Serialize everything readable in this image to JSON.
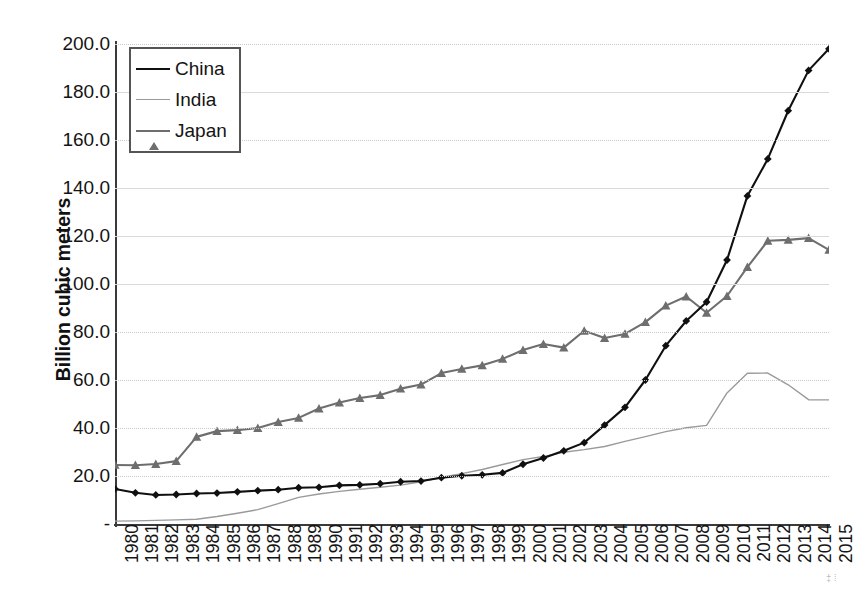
{
  "chart_data": {
    "type": "line",
    "title": "",
    "subtitle": "",
    "xlabel": "",
    "ylabel": "Billion cubic meters",
    "grid": true,
    "legend_position": "top-left",
    "xlim": [
      1980,
      2015
    ],
    "ylim": [
      0,
      200
    ],
    "ytick_labels": [
      "-",
      "20.0",
      "40.0",
      "60.0",
      "80.0",
      "100.0",
      "120.0",
      "140.0",
      "160.0",
      "180.0",
      "200.0"
    ],
    "ytick_values": [
      0,
      20,
      40,
      60,
      80,
      100,
      120,
      140,
      160,
      180,
      200
    ],
    "categories": [
      "1980",
      "1981",
      "1982",
      "1983",
      "1984",
      "1985",
      "1986",
      "1987",
      "1988",
      "1989",
      "1990",
      "1991",
      "1992",
      "1993",
      "1994",
      "1995",
      "1996",
      "1997",
      "1998",
      "1999",
      "2000",
      "2001",
      "2002",
      "2003",
      "2004",
      "2005",
      "2006",
      "2007",
      "2008",
      "2009",
      "2010",
      "2011",
      "2012",
      "2013",
      "2014",
      "2015"
    ],
    "series": [
      {
        "name": "China",
        "color": "#101010",
        "marker": "diamond",
        "values": [
          14.6,
          13.0,
          12.1,
          12.3,
          12.7,
          12.9,
          13.4,
          13.9,
          14.3,
          15.1,
          15.3,
          16.1,
          16.3,
          16.8,
          17.6,
          17.9,
          19.3,
          20.1,
          20.5,
          21.3,
          24.9,
          27.5,
          30.5,
          33.9,
          41.2,
          48.6,
          60.0,
          74.3,
          84.6,
          92.5,
          110.0,
          136.7,
          152.1,
          172.2,
          189.0,
          198.0
        ]
      },
      {
        "name": "India",
        "color": "#9a9a9a",
        "marker": "none",
        "values": [
          1.2,
          1.3,
          1.5,
          1.7,
          2.0,
          3.1,
          4.5,
          6.0,
          8.5,
          11.1,
          12.5,
          13.6,
          14.5,
          15.3,
          16.2,
          17.6,
          19.5,
          21.0,
          22.7,
          24.8,
          26.8,
          28.1,
          29.9,
          31.0,
          32.3,
          34.4,
          36.4,
          38.5,
          40.1,
          41.1,
          54.6,
          62.8,
          62.9,
          58.0,
          51.8,
          51.7
        ]
      },
      {
        "name": "Japan",
        "color": "#6e6e6e",
        "marker": "triangle",
        "values": [
          24.6,
          24.5,
          25.0,
          26.2,
          36.3,
          38.7,
          39.1,
          40.0,
          42.5,
          44.2,
          48.1,
          50.6,
          52.5,
          53.7,
          56.4,
          58.1,
          62.9,
          64.6,
          66.1,
          68.8,
          72.5,
          75.0,
          73.5,
          80.5,
          77.5,
          79.2,
          84.1,
          91.0,
          94.8,
          88.0,
          95.0,
          107.0,
          118.0,
          118.4,
          119.1,
          114.2
        ]
      }
    ]
  },
  "legend": {
    "entries": [
      {
        "label": "China",
        "icon": "line-with-diamond-marker-icon"
      },
      {
        "label": "India",
        "icon": "plain-line-icon"
      },
      {
        "label": "Japan",
        "icon": "line-with-triangle-marker-icon"
      }
    ]
  },
  "artifact": {
    "corner_mark": "‡⁞"
  }
}
